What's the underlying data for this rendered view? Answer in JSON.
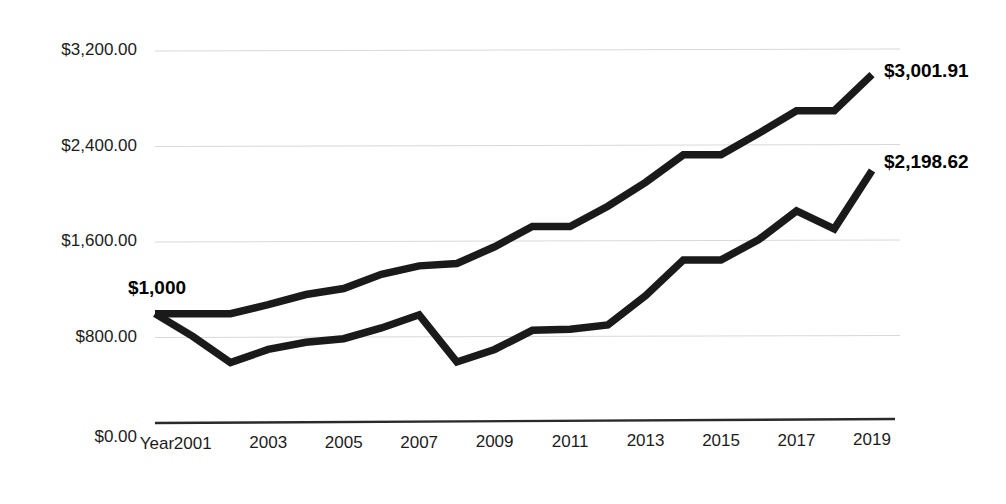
{
  "chart_data": {
    "type": "line",
    "title": "",
    "xlabel": "Year",
    "ylabel": "",
    "grid": true,
    "legend": "none",
    "xlim": [
      2000,
      2019
    ],
    "ylim": [
      0,
      3200
    ],
    "x": [
      2000,
      2001,
      2002,
      2003,
      2004,
      2005,
      2006,
      2007,
      2008,
      2009,
      2010,
      2011,
      2012,
      2013,
      2014,
      2015,
      2016,
      2017,
      2018,
      2019
    ],
    "x_tick_labels": [
      "Year",
      "2001",
      "2003",
      "2005",
      "2007",
      "2009",
      "2011",
      "2013",
      "2015",
      "2017",
      "2019"
    ],
    "y_tick_labels": [
      "$3,200.00",
      "$2,400.00",
      "$1,600.00",
      "$800.00",
      "$0.00"
    ],
    "y_tick_values": [
      3200,
      2400,
      1600,
      800,
      0
    ],
    "series": [
      {
        "name": "upper-series",
        "end_label": "$3,001.91",
        "end_value": 3001.91,
        "values": [
          1000,
          1000,
          1000,
          1075,
          1160,
          1210,
          1330,
          1400,
          1420,
          1560,
          1730,
          1730,
          1900,
          2100,
          2330,
          2330,
          2510,
          2700,
          2700,
          3001.91
        ]
      },
      {
        "name": "lower-series",
        "end_label": "$2,198.62",
        "end_value": 2198.62,
        "values": [
          1000,
          810,
          590,
          700,
          760,
          790,
          880,
          990,
          595,
          700,
          860,
          870,
          905,
          1150,
          1450,
          1450,
          1620,
          1860,
          1710,
          2198.62
        ]
      }
    ],
    "annotations": [
      {
        "name": "start-value-label",
        "text": "$1,000",
        "x": 2000,
        "y": 1000
      },
      {
        "name": "upper-end-label",
        "text": "$3,001.91",
        "x": 2019,
        "y": 3001.91
      },
      {
        "name": "lower-end-label",
        "text": "$2,198.62",
        "x": 2019,
        "y": 2198.62
      }
    ],
    "colors": {
      "line": "#1a1a1a",
      "grid": "#d8d8d8",
      "axis": "#2a2a2a",
      "text": "#1c1c1c",
      "background": "#ffffff"
    }
  }
}
